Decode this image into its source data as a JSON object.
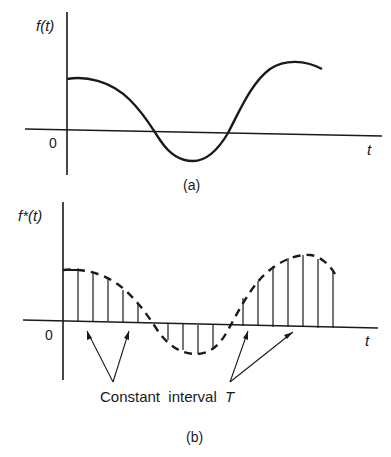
{
  "figure_a": {
    "y_label": "f(t)",
    "x_label": "t",
    "origin_label": "0",
    "caption": "(a)"
  },
  "figure_b": {
    "y_label": "f*(t)",
    "x_label": "t",
    "origin_label": "0",
    "annotation": "Constant  interval",
    "annotation_symbol": "T",
    "caption": "(b)"
  },
  "colors": {
    "ink": "#1a1a1a",
    "background": "#ffffff"
  }
}
